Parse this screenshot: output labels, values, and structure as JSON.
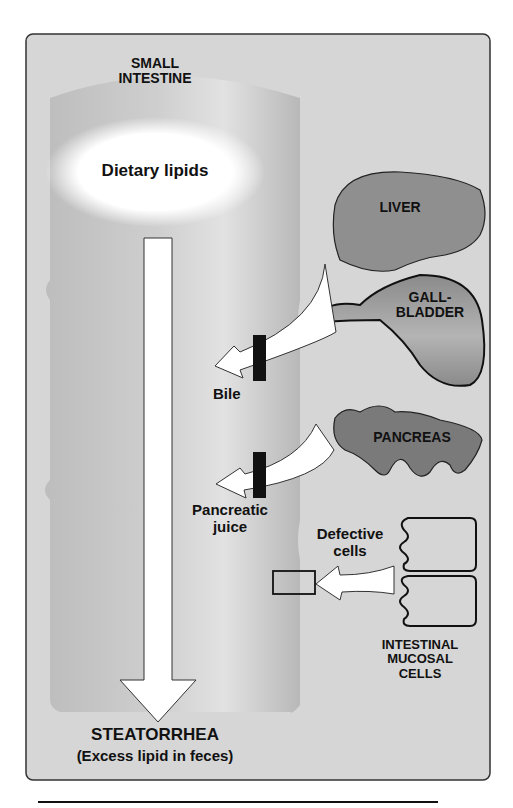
{
  "figure": {
    "title_label": [
      "SMALL",
      "INTESTINE"
    ],
    "dietary_lipids": "Dietary lipids",
    "organs": {
      "liver": "LIVER",
      "gallbladder": [
        "GALL-",
        "BLADDER"
      ],
      "pancreas": "PANCREAS",
      "mucosa": [
        "INTESTINAL",
        "MUCOSAL",
        "CELLS"
      ]
    },
    "inputs": {
      "bile": "Bile",
      "pancreatic_juice": [
        "Pancreatic",
        "juice"
      ],
      "defective_cells": [
        "Defective",
        "cells"
      ]
    },
    "outcome": {
      "title": "STEATORRHEA",
      "subtitle": "(Excess lipid in feces)"
    },
    "colors": {
      "panel_bg": "#d3d3d3",
      "panel_border": "#333333",
      "intestine": "#c4c4c4",
      "organ_fill": "#8c8c8c",
      "block_bar": "#111111",
      "arrow_fill": "#ffffff"
    }
  }
}
